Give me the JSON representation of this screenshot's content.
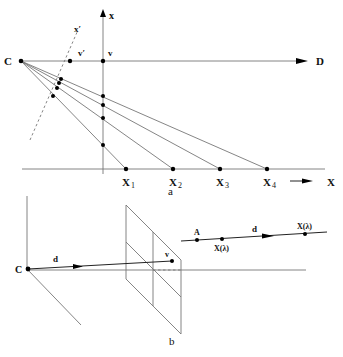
{
  "figure": {
    "panel_a": {
      "caption": "a",
      "labels": {
        "C": "C",
        "D": "D",
        "x_axis_vertical": "x",
        "x_prime": "x′",
        "v": "v",
        "v_prime": "v′",
        "X_axis": "X",
        "X1": "X",
        "X1_sub": "1",
        "X2": "X",
        "X2_sub": "2",
        "X3": "X",
        "X3_sub": "3",
        "X4": "X",
        "X4_sub": "4"
      }
    },
    "panel_b": {
      "caption": "b",
      "labels": {
        "C": "C",
        "d_left": "d",
        "v": "v",
        "A": "A",
        "X_lambda_1": "X(λ)",
        "d_right": "d",
        "X_lambda_2": "X(λ)"
      }
    }
  }
}
